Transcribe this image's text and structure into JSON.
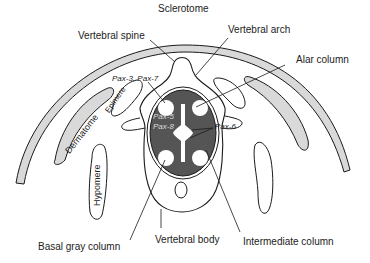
{
  "diagram": {
    "title": "Sclerotome",
    "labels": {
      "sclerotome": "Sclerotome",
      "vertebral_spine": "Vertebral spine",
      "vertebral_arch": "Vertebral arch",
      "alar_column": "Alar column",
      "pax_3_7": "Pax-3, Pax-7",
      "epimere": "Epimere",
      "dermatome": "Dermatome",
      "hypomere": "Hypomere",
      "pax_5": "Pax-5",
      "pax_8": "Pax-8",
      "pax_6": "Pax-6",
      "basal_gray_column": "Basal gray column",
      "vertebral_body": "Vertebral body",
      "intermediate_column": "Intermediate column"
    },
    "colors": {
      "outline": "#1a1a1a",
      "band_fill": "#d9d9d9",
      "cord_fill": "#555555",
      "gray_matter_hole": "#ffffff"
    }
  }
}
